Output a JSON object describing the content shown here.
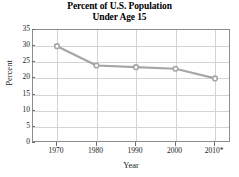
{
  "chart_data": {
    "type": "line",
    "title": "Percent of U.S. Population Under Age 15",
    "title_line1": "Percent of U.S. Population",
    "title_line2": "Under Age 15",
    "xlabel": "Year",
    "ylabel": "Percent",
    "categories": [
      "1970",
      "1980",
      "1990",
      "2000",
      "2010*"
    ],
    "x": [
      1970,
      1980,
      1990,
      2000,
      2010
    ],
    "values": [
      30,
      24,
      23.5,
      23,
      20
    ],
    "series": [
      {
        "name": "Percent of U.S. Population Under Age 15",
        "values": [
          30,
          24,
          23.5,
          23,
          20
        ]
      }
    ],
    "ylim": [
      0,
      35
    ],
    "yticks": [
      0,
      5,
      10,
      15,
      20,
      25,
      30,
      35
    ],
    "ytick_labels": [
      "0",
      "5",
      "10",
      "15",
      "20",
      "25",
      "30",
      "35"
    ],
    "xtick_labels": [
      "1970",
      "1980",
      "1990",
      "2000",
      "2010*"
    ],
    "grid": true,
    "legend": false,
    "legend_position": "none",
    "annotations": [
      "* 2010 value is marked with an asterisk"
    ],
    "colors": {
      "line": "#a6a6a6",
      "marker": "#a6a6a6",
      "grid": "#d4d4d4",
      "frame": "#8c8c8c",
      "text": "#1a1a1a",
      "background": "#ffffff"
    }
  }
}
